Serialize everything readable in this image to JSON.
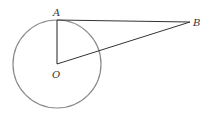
{
  "diagram": {
    "type": "geometry",
    "points": {
      "A": {
        "label": "A",
        "x": 57,
        "y": 20
      },
      "O": {
        "label": "O",
        "x": 57,
        "y": 64
      },
      "B": {
        "label": "B",
        "x": 190,
        "y": 22
      }
    },
    "circle": {
      "center": "O",
      "cx": 57,
      "cy": 64,
      "r": 44
    },
    "segments": [
      {
        "from": "A",
        "to": "B"
      },
      {
        "from": "O",
        "to": "A"
      },
      {
        "from": "O",
        "to": "B"
      }
    ],
    "colors": {
      "circle": "#8a8a8a",
      "lines": "#333333",
      "labels": "#333333"
    }
  }
}
